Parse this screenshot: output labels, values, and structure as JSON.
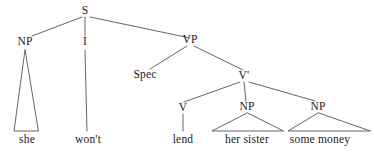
{
  "figure": {
    "name": "syntax-tree",
    "type": "constituency-tree",
    "sentence": "she won't lend her sister some money",
    "width": 374,
    "height": 154,
    "background_color": "#ffffff",
    "line_color": "#555555",
    "text_color": "#1a1a1a"
  },
  "nodes": [
    {
      "id": "S",
      "label": "S",
      "x": 85,
      "y": 11
    },
    {
      "id": "NP1",
      "label": "NP",
      "x": 25,
      "y": 42
    },
    {
      "id": "I",
      "label": "I",
      "x": 85,
      "y": 42
    },
    {
      "id": "VP",
      "label": "VP",
      "x": 190,
      "y": 40
    },
    {
      "id": "Spec",
      "label": "Spec",
      "x": 145,
      "y": 75
    },
    {
      "id": "Vbar",
      "label": "V'",
      "x": 244,
      "y": 76
    },
    {
      "id": "V",
      "label": "V",
      "x": 183,
      "y": 108
    },
    {
      "id": "NP2",
      "label": "NP",
      "x": 247,
      "y": 107
    },
    {
      "id": "NP3",
      "label": "NP",
      "x": 318,
      "y": 107
    }
  ],
  "terminals": [
    {
      "id": "she",
      "label": "she",
      "x": 27,
      "y": 140
    },
    {
      "id": "wont",
      "label": "won't",
      "x": 88,
      "y": 140
    },
    {
      "id": "lend",
      "label": "lend",
      "x": 183,
      "y": 140
    },
    {
      "id": "her-sister",
      "label": "her sister",
      "x": 247,
      "y": 140
    },
    {
      "id": "some-money",
      "label": "some money",
      "x": 320,
      "y": 140
    }
  ],
  "edges": [
    {
      "from": "S",
      "to": "NP1",
      "kind": "line",
      "x1": 82,
      "y1": 17,
      "x2": 32,
      "y2": 36
    },
    {
      "from": "S",
      "to": "I",
      "kind": "line",
      "x1": 85,
      "y1": 17,
      "x2": 85,
      "y2": 36
    },
    {
      "from": "S",
      "to": "VP",
      "kind": "line",
      "x1": 90,
      "y1": 17,
      "x2": 190,
      "y2": 38
    },
    {
      "from": "NP1",
      "to": "she",
      "kind": "triangle",
      "apex_x": 25,
      "apex_y": 50,
      "left_x": 14,
      "right_x": 38,
      "base_y": 131
    },
    {
      "from": "I",
      "to": "wont",
      "kind": "line",
      "x1": 85,
      "y1": 50,
      "x2": 87,
      "y2": 131
    },
    {
      "from": "VP",
      "to": "Spec",
      "kind": "line",
      "x1": 187,
      "y1": 46,
      "x2": 150,
      "y2": 69
    },
    {
      "from": "VP",
      "to": "Vbar",
      "kind": "line",
      "x1": 194,
      "y1": 46,
      "x2": 243,
      "y2": 70
    },
    {
      "from": "Vbar",
      "to": "V",
      "kind": "line",
      "x1": 240,
      "y1": 82,
      "x2": 184,
      "y2": 102
    },
    {
      "from": "Vbar",
      "to": "NP2",
      "kind": "line",
      "x1": 244,
      "y1": 82,
      "x2": 246,
      "y2": 101
    },
    {
      "from": "Vbar",
      "to": "NP3",
      "kind": "line",
      "x1": 249,
      "y1": 82,
      "x2": 315,
      "y2": 101
    },
    {
      "from": "V",
      "to": "lend",
      "kind": "line",
      "x1": 183,
      "y1": 114,
      "x2": 183,
      "y2": 131
    },
    {
      "from": "NP2",
      "to": "her-sister",
      "kind": "triangle",
      "apex_x": 247,
      "apex_y": 113,
      "left_x": 212,
      "right_x": 283,
      "base_y": 131
    },
    {
      "from": "NP3",
      "to": "some-money",
      "kind": "triangle",
      "apex_x": 318,
      "apex_y": 113,
      "left_x": 288,
      "right_x": 370,
      "base_y": 131
    }
  ],
  "chart_data": {
    "type": "diagram",
    "root": "S",
    "structure": [
      {
        "parent": "S",
        "children": [
          "NP",
          "I",
          "VP"
        ]
      },
      {
        "parent": "NP",
        "children": [
          "she"
        ]
      },
      {
        "parent": "I",
        "children": [
          "won't"
        ]
      },
      {
        "parent": "VP",
        "children": [
          "Spec",
          "V'"
        ]
      },
      {
        "parent": "V'",
        "children": [
          "V",
          "NP",
          "NP"
        ]
      },
      {
        "parent": "V",
        "children": [
          "lend"
        ]
      },
      {
        "parent": "NP",
        "children": [
          "her sister"
        ]
      },
      {
        "parent": "NP",
        "children": [
          "some money"
        ]
      }
    ]
  }
}
